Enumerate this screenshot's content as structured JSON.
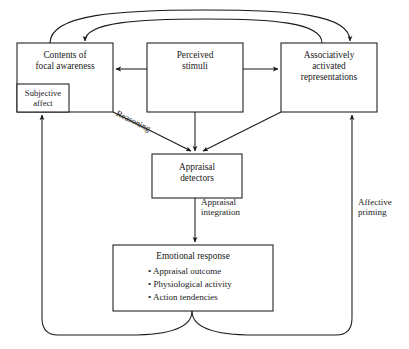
{
  "diagram": {
    "style": {
      "stroke": "#1a1a1a",
      "fill": "#ffffff",
      "background": "#ffffff"
    },
    "nodes": [
      {
        "id": "contents-focal-awareness",
        "label": "Contents of\nfocal awareness",
        "x": 17,
        "y": 43,
        "w": 96,
        "h": 69
      },
      {
        "id": "subjective-affect",
        "label": "Subjective\naffect",
        "x": 17,
        "y": 84,
        "w": 52,
        "h": 28
      },
      {
        "id": "perceived-stimuli",
        "label": "Perceived\nstimuli",
        "x": 147,
        "y": 43,
        "w": 96,
        "h": 69
      },
      {
        "id": "associatively-activated-representations",
        "label": "Associatively\nactivated\nrepresentations",
        "x": 281,
        "y": 43,
        "w": 96,
        "h": 69
      },
      {
        "id": "appraisal-detectors",
        "label": "Appraisal\ndetectors",
        "x": 152,
        "y": 154,
        "w": 90,
        "h": 44
      },
      {
        "id": "emotional-response",
        "label": "Emotional response",
        "x": 113,
        "y": 245,
        "w": 160,
        "h": 66,
        "bullets": [
          "• Appraisal outcome",
          "• Physiological activity",
          "• Action tendencies"
        ]
      }
    ],
    "edge_labels": [
      {
        "id": "reasoning",
        "text": "Reasoning",
        "x": 118,
        "y": 110,
        "rotation": 34
      },
      {
        "id": "appraisal-integration",
        "text": "Appraisal\nintegration",
        "x": 203,
        "y": 203
      },
      {
        "id": "affective-priming",
        "text": "Affective\npriming",
        "x": 361,
        "y": 203
      }
    ],
    "edges": [
      {
        "id": "stimuli-to-contents",
        "from": "perceived-stimuli",
        "to": "contents-focal-awareness",
        "kind": "arrow-left"
      },
      {
        "id": "stimuli-to-representations",
        "from": "perceived-stimuli",
        "to": "associatively-activated-representations",
        "kind": "arrow-right"
      },
      {
        "id": "contents-to-detectors",
        "from": "contents-focal-awareness",
        "to": "appraisal-detectors",
        "kind": "diagonal",
        "label": "Reasoning"
      },
      {
        "id": "stimuli-to-detectors",
        "from": "perceived-stimuli",
        "to": "appraisal-detectors",
        "kind": "vertical"
      },
      {
        "id": "representations-to-detectors",
        "from": "associatively-activated-representations",
        "to": "appraisal-detectors",
        "kind": "diagonal"
      },
      {
        "id": "detectors-to-emotional-response",
        "from": "appraisal-detectors",
        "to": "emotional-response",
        "kind": "vertical",
        "label": "Appraisal integration"
      },
      {
        "id": "emotional-response-to-subjective-affect",
        "from": "emotional-response",
        "to": "subjective-affect",
        "kind": "feedback-left"
      },
      {
        "id": "emotional-response-to-representations",
        "from": "emotional-response",
        "to": "associatively-activated-representations",
        "kind": "feedback-right",
        "label": "Affective priming"
      },
      {
        "id": "contents-to-representations-top",
        "from": "contents-focal-awareness",
        "to": "associatively-activated-representations",
        "kind": "feedback-top-outer"
      },
      {
        "id": "representations-to-contents-top",
        "from": "associatively-activated-representations",
        "to": "contents-focal-awareness",
        "kind": "feedback-top-inner"
      }
    ]
  }
}
